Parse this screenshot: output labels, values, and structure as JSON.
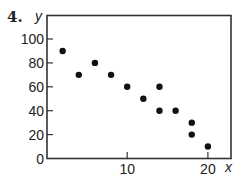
{
  "problem_number": "4.",
  "chart_data": {
    "type": "scatter",
    "title": "",
    "xlabel": "x",
    "ylabel": "y",
    "xlim": [
      0,
      22.5
    ],
    "ylim": [
      0,
      120
    ],
    "grid": false,
    "legend": null,
    "x_ticks": [
      10,
      20
    ],
    "x_tick_labels": [
      "10",
      "20"
    ],
    "y_ticks": [
      0,
      20,
      40,
      60,
      80,
      100
    ],
    "y_tick_labels": [
      "0",
      "20",
      "40",
      "60",
      "80",
      "100"
    ],
    "points": [
      {
        "x": 2,
        "y": 90
      },
      {
        "x": 4,
        "y": 70
      },
      {
        "x": 6,
        "y": 80
      },
      {
        "x": 8,
        "y": 70
      },
      {
        "x": 10,
        "y": 60
      },
      {
        "x": 12,
        "y": 50
      },
      {
        "x": 14,
        "y": 60
      },
      {
        "x": 14,
        "y": 40
      },
      {
        "x": 16,
        "y": 40
      },
      {
        "x": 18,
        "y": 30
      },
      {
        "x": 18,
        "y": 20
      },
      {
        "x": 20,
        "y": 10
      }
    ],
    "marker_color": "#111111",
    "axis_color": "#333333"
  }
}
